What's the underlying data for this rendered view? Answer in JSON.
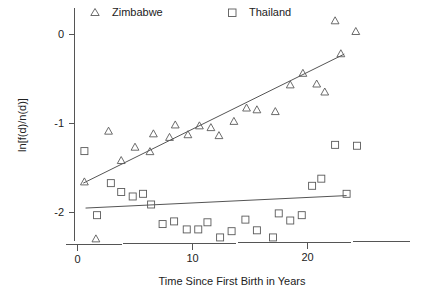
{
  "chart_data": {
    "type": "scatter",
    "title": "",
    "subtitle": "",
    "xlabel": "Time Since First Birth in Years",
    "ylabel": "ln[f(d)/n(d)]",
    "xlim": [
      -0.6,
      30.0
    ],
    "ylim": [
      -2.45,
      0.28
    ],
    "xticks": [
      0,
      10,
      20
    ],
    "xticklabels": [
      "0",
      "10",
      "20"
    ],
    "yticks": [
      0,
      -1,
      -2
    ],
    "yticklabels": [
      "0",
      "-1",
      "-2"
    ],
    "grid": false,
    "legend_position": "top",
    "legend": [
      {
        "name": "Zimbabwe",
        "marker": "triangle-up"
      },
      {
        "name": "Thailand",
        "marker": "square"
      }
    ],
    "series": [
      {
        "name": "Zimbabwe",
        "marker": "triangle-up",
        "color": "#5a5a5a",
        "points": [
          [
            0.6,
            -1.66
          ],
          [
            1.6,
            -2.3
          ],
          [
            2.7,
            -1.09
          ],
          [
            3.8,
            -1.42
          ],
          [
            5.0,
            -1.27
          ],
          [
            6.3,
            -1.32
          ],
          [
            6.6,
            -1.12
          ],
          [
            8.0,
            -1.16
          ],
          [
            8.5,
            -1.02
          ],
          [
            9.6,
            -1.13
          ],
          [
            10.6,
            -1.03
          ],
          [
            11.6,
            -1.05
          ],
          [
            12.3,
            -1.14
          ],
          [
            13.6,
            -0.98
          ],
          [
            14.7,
            -0.83
          ],
          [
            15.6,
            -0.85
          ],
          [
            17.2,
            -0.87
          ],
          [
            18.5,
            -0.57
          ],
          [
            19.6,
            -0.44
          ],
          [
            20.8,
            -0.56
          ],
          [
            21.5,
            -0.65
          ],
          [
            22.4,
            0.15
          ],
          [
            22.9,
            -0.22
          ],
          [
            24.2,
            0.03
          ]
        ]
      },
      {
        "name": "Thailand",
        "marker": "square",
        "color": "#5a5a5a",
        "points": [
          [
            0.6,
            -1.31
          ],
          [
            1.7,
            -2.03
          ],
          [
            2.9,
            -1.67
          ],
          [
            3.8,
            -1.77
          ],
          [
            4.8,
            -1.82
          ],
          [
            5.7,
            -1.79
          ],
          [
            6.4,
            -1.91
          ],
          [
            7.4,
            -2.13
          ],
          [
            8.4,
            -2.1
          ],
          [
            9.5,
            -2.19
          ],
          [
            10.5,
            -2.19
          ],
          [
            11.3,
            -2.11
          ],
          [
            12.4,
            -2.28
          ],
          [
            13.4,
            -2.21
          ],
          [
            14.6,
            -2.08
          ],
          [
            15.6,
            -2.2
          ],
          [
            17.0,
            -2.28
          ],
          [
            17.5,
            -2.01
          ],
          [
            18.5,
            -2.09
          ],
          [
            19.5,
            -2.03
          ],
          [
            20.4,
            -1.7
          ],
          [
            21.2,
            -1.62
          ],
          [
            22.4,
            -1.24
          ],
          [
            23.4,
            -1.79
          ],
          [
            24.3,
            -1.25
          ]
        ]
      }
    ],
    "fit_lines": [
      {
        "name": "Zimbabwe fit",
        "series": "Zimbabwe",
        "x_start": 0.5,
        "y_start": -1.67,
        "x_end": 23.2,
        "y_end": -0.22,
        "color": "#555555"
      },
      {
        "name": "Thailand fit",
        "series": "Thailand",
        "x_start": 0.7,
        "y_start": -1.95,
        "x_end": 23.4,
        "y_end": -1.81,
        "color": "#555555"
      }
    ]
  },
  "axes": {
    "y_axis_name": "y-axis",
    "x_axis_name": "x-axis"
  }
}
